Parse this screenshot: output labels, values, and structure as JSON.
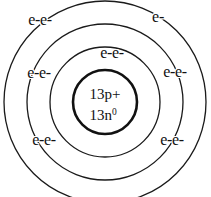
{
  "diagram": {
    "background_color": "#ffffff",
    "stroke_color": "#1a1a1a",
    "nucleus": {
      "protons_label": "13p+",
      "neutrons_label": "13n",
      "neutrons_superscript": "0",
      "center_x": 105,
      "center_y": 102,
      "radius": 32
    },
    "shells": [
      {
        "name": "shell-1",
        "radius": 55
      },
      {
        "name": "shell-2",
        "radius": 78
      },
      {
        "name": "shell-3",
        "radius": 101
      }
    ],
    "electron_labels": [
      {
        "name": "electrons-outer-top-left",
        "text": "e-e-",
        "x": 40,
        "y": 20
      },
      {
        "name": "electrons-outer-top-right",
        "text": "e-",
        "x": 158,
        "y": 17
      },
      {
        "name": "electrons-shell2-top",
        "text": "e-e-",
        "x": 112,
        "y": 53
      },
      {
        "name": "electrons-outer-middle-left",
        "text": "e-e-",
        "x": 39,
        "y": 73
      },
      {
        "name": "electrons-outer-middle-right",
        "text": "e-e-",
        "x": 175,
        "y": 72
      },
      {
        "name": "electrons-outer-bottom-left",
        "text": "e-e-",
        "x": 44,
        "y": 140
      },
      {
        "name": "electrons-outer-bottom-right",
        "text": "e-e-",
        "x": 172,
        "y": 140
      }
    ]
  }
}
